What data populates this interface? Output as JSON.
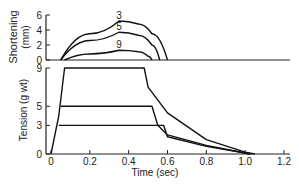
{
  "chart_data": [
    {
      "type": "line",
      "panel": "top",
      "ylabel": "Shortening (mm)",
      "ylabel_line1": "Shortening",
      "ylabel_line2": "(mm)",
      "yticks": [
        "0",
        "2",
        "4",
        "6"
      ],
      "ylim": [
        0,
        6
      ],
      "xlim": [
        0,
        1.2
      ],
      "series": [
        {
          "name": "3",
          "points": [
            [
              0.05,
              0
            ],
            [
              0.2,
              3.5
            ],
            [
              0.35,
              5.2
            ],
            [
              0.45,
              4.8
            ],
            [
              0.52,
              3.5
            ],
            [
              0.6,
              0
            ]
          ]
        },
        {
          "name": "5",
          "points": [
            [
              0.05,
              0
            ],
            [
              0.2,
              2.6
            ],
            [
              0.35,
              3.7
            ],
            [
              0.45,
              3.3
            ],
            [
              0.52,
              2.0
            ],
            [
              0.56,
              0
            ]
          ]
        },
        {
          "name": "9",
          "points": [
            [
              0.07,
              0
            ],
            [
              0.2,
              0.8
            ],
            [
              0.35,
              1.3
            ],
            [
              0.45,
              1.1
            ],
            [
              0.5,
              0.5
            ],
            [
              0.52,
              0
            ]
          ]
        }
      ]
    },
    {
      "type": "line",
      "panel": "bottom",
      "ylabel": "Tension (g wt)",
      "xlabel": "Time (sec)",
      "yticks": [
        "0",
        "3",
        "5",
        "9"
      ],
      "xticks": [
        "0",
        "0.2",
        "0.4",
        "0.6",
        "0.8",
        "1.0",
        "1.2"
      ],
      "ylim": [
        0,
        9
      ],
      "xlim": [
        0,
        1.2
      ],
      "series": [
        {
          "name": "9",
          "points": [
            [
              0,
              0
            ],
            [
              0.04,
              4
            ],
            [
              0.07,
              9
            ],
            [
              0.48,
              9
            ],
            [
              0.5,
              7
            ],
            [
              0.6,
              4.3
            ],
            [
              0.8,
              1.5
            ],
            [
              1.0,
              0.2
            ],
            [
              1.05,
              0
            ]
          ]
        },
        {
          "name": "5",
          "points": [
            [
              0.05,
              5
            ],
            [
              0.52,
              5
            ],
            [
              0.55,
              3
            ],
            [
              0.6,
              2
            ],
            [
              0.8,
              0.9
            ],
            [
              1.0,
              0.1
            ],
            [
              1.03,
              0
            ]
          ]
        },
        {
          "name": "3",
          "points": [
            [
              0.04,
              3
            ],
            [
              0.58,
              3
            ],
            [
              0.6,
              1.8
            ],
            [
              0.8,
              0.8
            ],
            [
              1.0,
              0.1
            ],
            [
              1.02,
              0
            ]
          ]
        }
      ]
    }
  ]
}
